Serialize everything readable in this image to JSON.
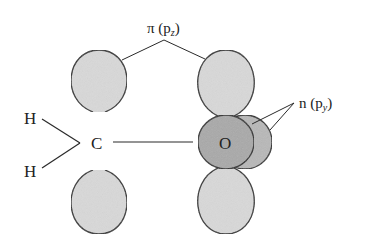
{
  "diagram": {
    "title_label": {
      "main": "π (p",
      "sub": "z",
      "close": ")"
    },
    "n_label": {
      "main": "n (p",
      "sub": "y",
      "close": ")"
    },
    "atoms": {
      "h_top": "H",
      "h_bottom": "H",
      "carbon": "C",
      "oxygen": "O"
    },
    "colors": {
      "lobe_fill": "#d9d9d9",
      "oxygen_front": "#a9a9a9",
      "oxygen_back": "#b8b8b8",
      "stroke": "#2a2a2a"
    }
  }
}
